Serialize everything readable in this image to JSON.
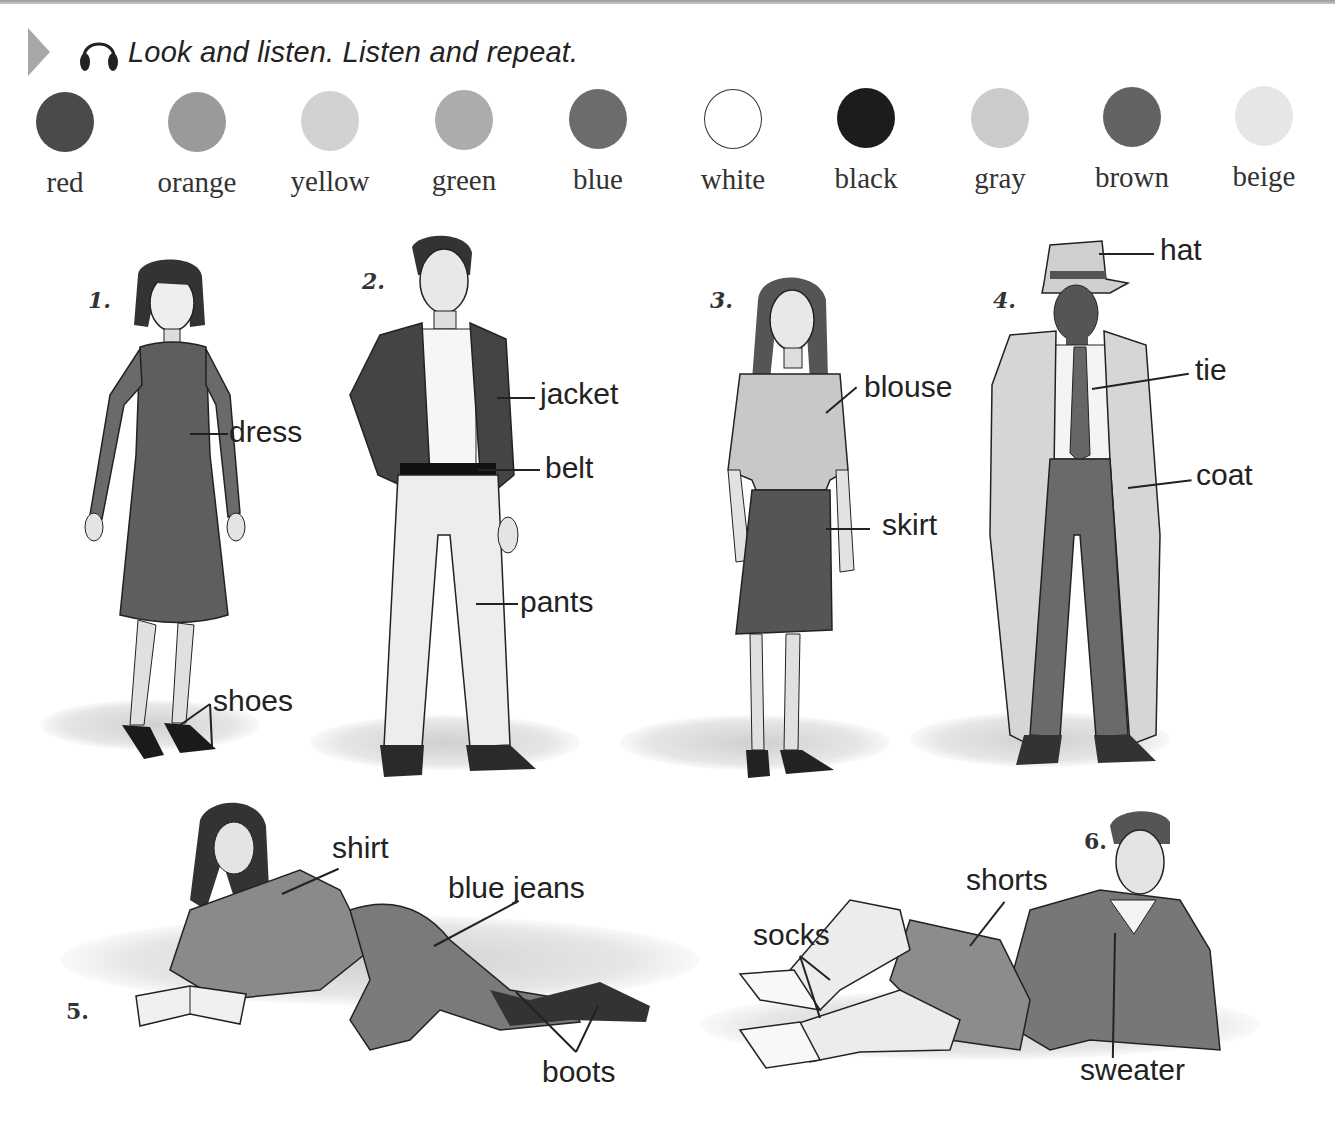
{
  "header": {
    "instruction": "Look and listen. Listen and repeat.",
    "icons": [
      "play-triangle-icon",
      "headphones-icon"
    ]
  },
  "colors": [
    {
      "name": "red",
      "swatch": "#4a4a4a"
    },
    {
      "name": "orange",
      "swatch": "#9a9a9a"
    },
    {
      "name": "yellow",
      "swatch": "#d2d2d2"
    },
    {
      "name": "green",
      "swatch": "#acacac"
    },
    {
      "name": "blue",
      "swatch": "#6c6c6c"
    },
    {
      "name": "white",
      "swatch": "#ffffff"
    },
    {
      "name": "black",
      "swatch": "#1c1c1c"
    },
    {
      "name": "gray",
      "swatch": "#cccccc"
    },
    {
      "name": "brown",
      "swatch": "#636363"
    },
    {
      "name": "beige",
      "swatch": "#e6e6e6"
    }
  ],
  "figures": [
    {
      "number": "1.",
      "labels": [
        "dress",
        "shoes"
      ]
    },
    {
      "number": "2.",
      "labels": [
        "jacket",
        "belt",
        "pants"
      ]
    },
    {
      "number": "3.",
      "labels": [
        "blouse",
        "skirt"
      ]
    },
    {
      "number": "4.",
      "labels": [
        "hat",
        "tie",
        "coat"
      ]
    },
    {
      "number": "5.",
      "labels": [
        "shirt",
        "blue jeans",
        "boots"
      ]
    },
    {
      "number": "6.",
      "labels": [
        "shorts",
        "socks",
        "sweater"
      ]
    }
  ]
}
